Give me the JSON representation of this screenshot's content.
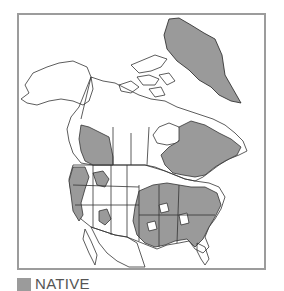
{
  "map": {
    "title": "",
    "region": "North America",
    "colors": {
      "native_fill": "#999999",
      "outline": "#333333",
      "frame_border": "#9c9c9c",
      "background": "#ffffff"
    }
  },
  "legend": {
    "items": [
      {
        "label": "NATIVE",
        "color": "#9b9b9b"
      }
    ]
  }
}
